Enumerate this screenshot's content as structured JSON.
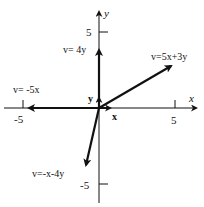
{
  "diagram": {
    "type": "vector-plot",
    "axes": {
      "x_label": "x",
      "y_label": "y",
      "x_ticks": [
        "-5",
        "5"
      ],
      "y_ticks": [
        "5",
        "-5"
      ]
    },
    "basis_labels": {
      "x": "x",
      "y": "y"
    },
    "vectors": [
      {
        "label": "v= 4y",
        "components": [
          0,
          4
        ]
      },
      {
        "label": "v=5x+3y",
        "components": [
          5,
          3
        ]
      },
      {
        "label": "v= -5x",
        "components": [
          -5,
          0
        ]
      },
      {
        "label": "v=-x-4y",
        "components": [
          -1,
          -4
        ]
      }
    ],
    "color": "#111111"
  }
}
